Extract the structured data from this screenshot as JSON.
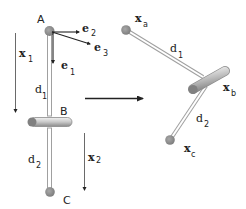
{
  "diagram": {
    "type": "double-pendulum-to-rigid-body-transform",
    "left": {
      "points": [
        {
          "id": "A",
          "label": "A"
        },
        {
          "id": "B",
          "label": "B"
        },
        {
          "id": "C",
          "label": "C"
        }
      ],
      "basis_vectors": [
        {
          "label": "e",
          "sub": "1"
        },
        {
          "label": "e",
          "sub": "2"
        },
        {
          "label": "e",
          "sub": "3"
        }
      ],
      "segments": [
        {
          "label": "d",
          "sub": "1"
        },
        {
          "label": "d",
          "sub": "2"
        }
      ],
      "displacements": [
        {
          "label": "x",
          "sub": "1"
        },
        {
          "label": "x",
          "sub": "2"
        }
      ]
    },
    "transform_arrow": "right-arrow",
    "right": {
      "points": [
        {
          "label": "x",
          "sub": "a"
        },
        {
          "label": "x",
          "sub": "b"
        },
        {
          "label": "x",
          "sub": "c"
        }
      ],
      "segments": [
        {
          "label": "d",
          "sub": "1"
        },
        {
          "label": "d",
          "sub": "2"
        }
      ]
    },
    "colors": {
      "ball": "#8c8c8c",
      "rod_outline": "#9a9a9a",
      "arrow": "#222222",
      "tube_light": "#e8e8e8",
      "tube_dark": "#7a7a7a"
    }
  }
}
